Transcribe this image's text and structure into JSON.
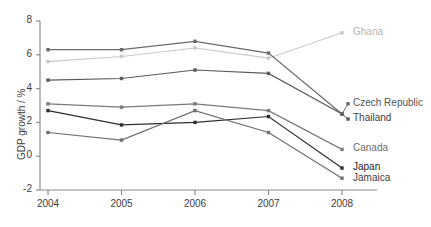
{
  "chart_data": {
    "type": "line",
    "title": "",
    "xlabel": "",
    "ylabel": "GDP growth / %",
    "categories": [
      "2004",
      "2005",
      "2006",
      "2007",
      "2008"
    ],
    "x": [
      2004,
      2005,
      2006,
      2007,
      2008
    ],
    "xlim": [
      2003.6,
      2008.6
    ],
    "ylim": [
      -2,
      8
    ],
    "yticks": [
      -2,
      0,
      2,
      4,
      6,
      8
    ],
    "ytick_labels": [
      "-2",
      "0",
      "2",
      "4",
      "6",
      "8"
    ],
    "xticks": [
      2004,
      2005,
      2006,
      2007,
      2008
    ],
    "xtick_labels": [
      "2004",
      "2005",
      "2006",
      "2007",
      "2008"
    ],
    "grid": false,
    "legend_position": "right-inline-labels",
    "markers": "square",
    "series": [
      {
        "name": "Ghana",
        "color": "#c9c9c9",
        "label_color": "#b5b5b5",
        "values": [
          5.6,
          5.9,
          6.4,
          5.8,
          7.3
        ],
        "label_y_value": 7.3
      },
      {
        "name": "Czech Republic",
        "color": "#6b6b6b",
        "label_color": "#555555",
        "values": [
          6.3,
          6.3,
          6.8,
          6.1,
          2.5
        ],
        "label_y_value": 3.1
      },
      {
        "name": "Thailand",
        "color": "#5a5a5a",
        "label_color": "#3d3d3d",
        "values": [
          4.5,
          4.6,
          5.1,
          4.9,
          2.5
        ],
        "label_y_value": 2.2
      },
      {
        "name": "Canada",
        "color": "#7a7a7a",
        "label_color": "#6b6b6b",
        "values": [
          3.1,
          2.9,
          3.1,
          2.7,
          0.4
        ],
        "label_y_value": 0.4
      },
      {
        "name": "Japan",
        "color": "#2e2e2e",
        "label_color": "#1c1c1c",
        "values": [
          2.7,
          1.85,
          2.0,
          2.35,
          -0.7
        ],
        "label_y_value": -0.7
      },
      {
        "name": "Jamaica",
        "color": "#6f6f6f",
        "label_color": "#3d3d3d",
        "values": [
          1.4,
          0.95,
          2.7,
          1.4,
          -1.3
        ],
        "label_y_value": -1.35
      }
    ]
  },
  "axes": {
    "axis_color": "#8c8c8c",
    "text_color": "#3d3d3d"
  }
}
